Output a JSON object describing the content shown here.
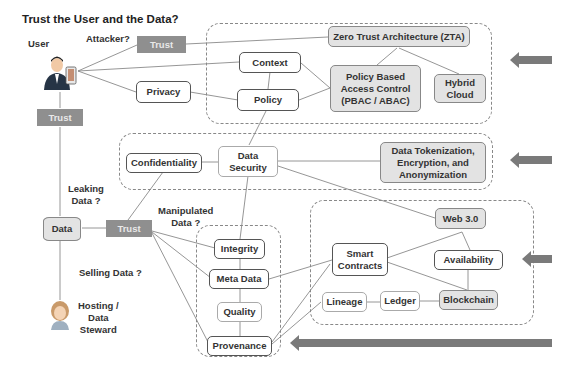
{
  "title": "Trust the User and the Data?",
  "actors": {
    "user": {
      "label": "User",
      "icon": "user-with-phone-icon"
    },
    "steward": {
      "label": "Hosting / Data Steward",
      "label_lines": [
        "Hosting /",
        "Data",
        "Steward"
      ],
      "icon": "data-steward-icon"
    }
  },
  "questions": {
    "attacker": "Attacker?",
    "leaking": [
      "Leaking",
      "Data ?"
    ],
    "manipulated": [
      "Manipulated",
      "Data ?"
    ],
    "selling": "Selling Data ?"
  },
  "trust_labels": {
    "top": "Trust",
    "left": "Trust",
    "mid": "Trust"
  },
  "data_node": {
    "label": "Data"
  },
  "groups": {
    "zta": {
      "nodes": {
        "zta": "Zero Trust Architecture (ZTA)",
        "context": "Context",
        "policy": "Policy",
        "pbac": [
          "Policy Based",
          "Access Control",
          "(PBAC / ABAC)"
        ],
        "hybrid": [
          "Hybrid",
          "Cloud"
        ]
      }
    },
    "security": {
      "nodes": {
        "confidentiality": "Confidentiality",
        "data_security": [
          "Data",
          "Security"
        ],
        "tokenization": [
          "Data Tokenization,",
          "Encryption, and",
          "Anonymization"
        ]
      }
    },
    "integrity": {
      "nodes": {
        "integrity": "Integrity",
        "meta_data": "Meta Data",
        "quality": "Quality",
        "provenance": "Provenance"
      }
    },
    "web3": {
      "nodes": {
        "web3": "Web 3.0",
        "smart_contracts": [
          "Smart",
          "Contracts"
        ],
        "availability": "Availability",
        "lineage": "Lineage",
        "ledger": "Ledger",
        "blockchain": "Blockchain"
      }
    }
  },
  "other_nodes": {
    "privacy": "Privacy"
  },
  "colors": {
    "trust_fill": "#8f8f8f",
    "shade_fill": "#e3e3e3",
    "arrow": "#7a7a7a",
    "line": "#888888"
  }
}
